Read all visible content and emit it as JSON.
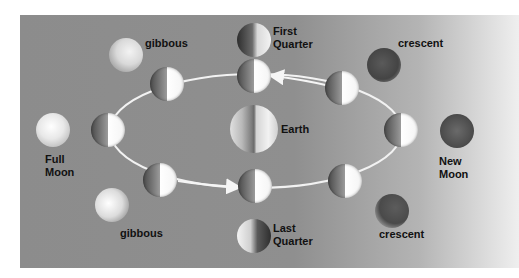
{
  "diagram": {
    "center": {
      "label": "Earth",
      "icon": "earth-icon"
    },
    "orbit_direction": "counterclockwise",
    "colors": {
      "panel_left": "#8c8c8c",
      "panel_right": "#efefef",
      "orbit_line": "#f5f5f5",
      "label_text": "#111111"
    },
    "orbit_moons_count": 8,
    "phases": [
      {
        "id": "new-moon",
        "label": "New\nMoon"
      },
      {
        "id": "crescent-waxing",
        "label": "crescent"
      },
      {
        "id": "first-quarter",
        "label": "First\nQuarter"
      },
      {
        "id": "gibbous-waxing",
        "label": "gibbous"
      },
      {
        "id": "full-moon",
        "label": "Full\nMoon"
      },
      {
        "id": "gibbous-waning",
        "label": "gibbous"
      },
      {
        "id": "last-quarter",
        "label": "Last\nQuarter"
      },
      {
        "id": "crescent-waning",
        "label": "crescent"
      }
    ]
  }
}
